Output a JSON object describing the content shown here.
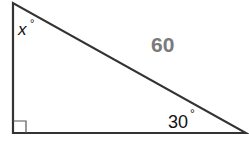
{
  "diagram": {
    "type": "right-triangle",
    "vertices": {
      "top": [
        13,
        3
      ],
      "right_angle": [
        13,
        133
      ],
      "right": [
        246,
        133
      ]
    },
    "right_angle_marker": true,
    "labels": {
      "top_angle": "x",
      "top_angle_degree": "°",
      "hypotenuse": "60",
      "right_angle_value": "30",
      "right_angle_degree": "°"
    },
    "colors": {
      "stroke": "#333333",
      "hypotenuse_label": "#7a7a7a",
      "text": "#111111"
    }
  }
}
